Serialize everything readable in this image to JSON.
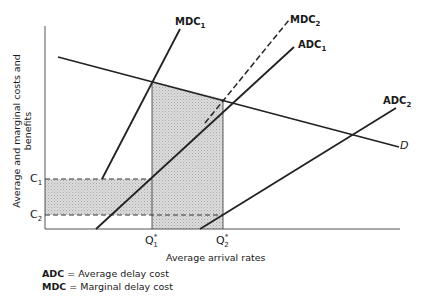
{
  "diagram": {
    "y_axis_label": "Average and marginal costs and benefits",
    "x_axis_label": "Average arrival rates",
    "curves": {
      "mdc1": {
        "name": "MDC",
        "sub": "1"
      },
      "mdc2": {
        "name": "MDC",
        "sub": "2"
      },
      "adc1": {
        "name": "ADC",
        "sub": "1"
      },
      "adc2": {
        "name": "ADC",
        "sub": "2"
      },
      "demand": {
        "name": "D"
      }
    },
    "y_ticks": {
      "c1": {
        "name": "C",
        "sub": "1"
      },
      "c2": {
        "name": "C",
        "sub": "2"
      }
    },
    "x_ticks": {
      "q1": {
        "name": "Q",
        "sup": "*",
        "sub": "1"
      },
      "q2": {
        "name": "Q",
        "sup": "*",
        "sub": "2"
      }
    },
    "legend": [
      {
        "abbr": "ADC",
        "desc": "= Average delay cost"
      },
      {
        "abbr": "MDC",
        "desc": "= Marginal delay cost"
      }
    ]
  }
}
